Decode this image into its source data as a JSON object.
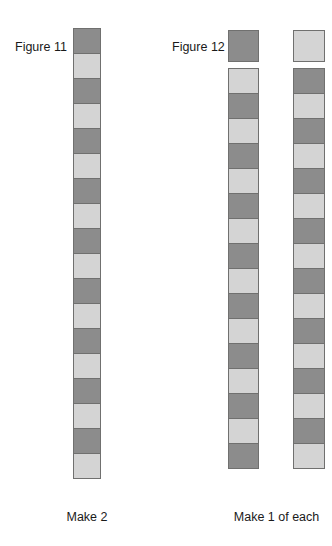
{
  "page": {
    "background_color": "#ffffff",
    "width": 332,
    "height": 546
  },
  "palette": {
    "dark": "#8c8c8c",
    "light": "#d4d4d4",
    "border": "#70706f",
    "text": "#1a1a1a"
  },
  "figures": [
    {
      "id": "figure-11",
      "label": "Figure 11",
      "caption": "Make 2",
      "strips": [
        {
          "id": "strip-1",
          "square_count": 18,
          "starts_with": "dark",
          "cells": [
            "dark",
            "light",
            "dark",
            "light",
            "dark",
            "light",
            "dark",
            "light",
            "dark",
            "light",
            "dark",
            "light",
            "dark",
            "light",
            "dark",
            "light",
            "dark",
            "light"
          ]
        }
      ],
      "legend_swatches": []
    },
    {
      "id": "figure-12",
      "label": "Figure 12",
      "caption": "Make 1 of each",
      "strips": [
        {
          "id": "strip-2",
          "square_count": 16,
          "starts_with": "light",
          "cells": [
            "light",
            "dark",
            "light",
            "dark",
            "light",
            "dark",
            "light",
            "dark",
            "light",
            "dark",
            "light",
            "dark",
            "light",
            "dark",
            "light",
            "dark"
          ]
        },
        {
          "id": "strip-3",
          "square_count": 16,
          "starts_with": "dark",
          "cells": [
            "dark",
            "light",
            "dark",
            "light",
            "dark",
            "light",
            "dark",
            "light",
            "dark",
            "light",
            "dark",
            "light",
            "dark",
            "light",
            "dark",
            "light"
          ]
        }
      ],
      "legend_swatches": [
        {
          "id": "swatch-dark",
          "tone": "dark"
        },
        {
          "id": "swatch-light",
          "tone": "light"
        }
      ]
    }
  ]
}
